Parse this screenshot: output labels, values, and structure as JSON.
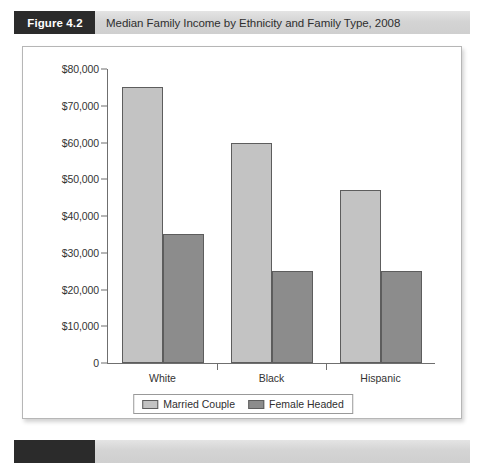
{
  "figure": {
    "badge": "Figure 4.2",
    "caption": "Median Family Income by Ethnicity and Family Type, 2008"
  },
  "colors": {
    "married_couple": "#c3c3c3",
    "female_headed": "#8c8c8c",
    "badge_background": "#2b2b2b",
    "header_background": "#d4d4d4",
    "axis": "#6f6f6f"
  },
  "chart_data": {
    "type": "bar",
    "title": "Median Family Income by Ethnicity and Family Type, 2008",
    "xlabel": "",
    "ylabel": "",
    "categories": [
      "White",
      "Black",
      "Hispanic"
    ],
    "series": [
      {
        "name": "Married Couple",
        "values": [
          75000,
          60000,
          47000
        ]
      },
      {
        "name": "Female Headed",
        "values": [
          35000,
          25000,
          25000
        ]
      }
    ],
    "ylim": [
      0,
      80000
    ],
    "ytick_values": [
      0,
      10000,
      20000,
      30000,
      40000,
      50000,
      60000,
      70000,
      80000
    ],
    "ytick_labels": [
      "0",
      "$10,000",
      "$20,000",
      "$30,000",
      "$40,000",
      "$50,000",
      "$60,000",
      "$70,000",
      "$80,000"
    ],
    "grid": false,
    "legend_position": "bottom"
  }
}
